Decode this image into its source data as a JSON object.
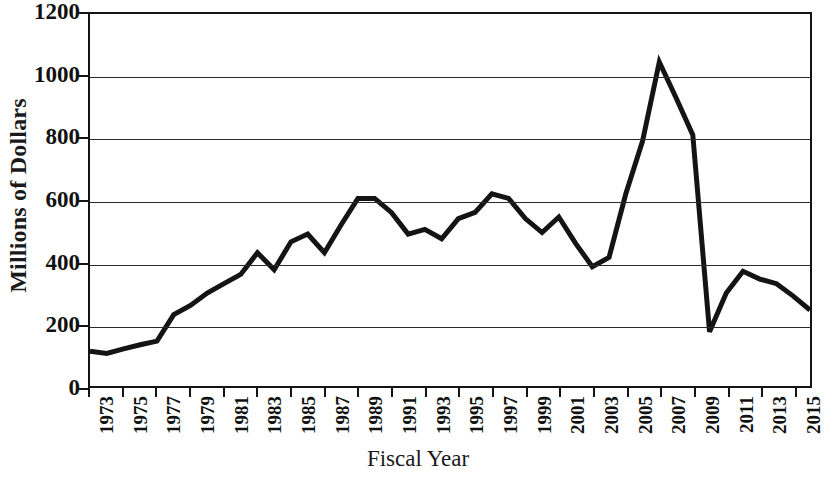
{
  "chart_data": {
    "type": "line",
    "title": "",
    "xlabel": "Fiscal Year",
    "ylabel": "Millions of Dollars",
    "xlim": [
      1973,
      2016
    ],
    "ylim": [
      0,
      1200
    ],
    "grid": true,
    "legend": null,
    "line_color": "#141414",
    "y_ticks": [
      0,
      200,
      400,
      600,
      800,
      1000,
      1200
    ],
    "y_tick_labels": [
      "0",
      "200",
      "400",
      "600",
      "800",
      "1000",
      "1200"
    ],
    "x_ticks": [
      1973,
      1975,
      1977,
      1979,
      1981,
      1983,
      1985,
      1987,
      1989,
      1991,
      1993,
      1995,
      1997,
      1999,
      2001,
      2003,
      2005,
      2007,
      2009,
      2011,
      2013,
      2015
    ],
    "x_tick_labels": [
      "1973",
      "1975",
      "1977",
      "1979",
      "1981",
      "1983",
      "1985",
      "1987",
      "1989",
      "1991",
      "1993",
      "1995",
      "1997",
      "1999",
      "2001",
      "2003",
      "2005",
      "2007",
      "2009",
      "2011",
      "2013",
      "2015"
    ],
    "x": [
      1973,
      1974,
      1975,
      1976,
      1977,
      1978,
      1979,
      1980,
      1981,
      1982,
      1983,
      1984,
      1985,
      1986,
      1987,
      1988,
      1989,
      1990,
      1991,
      1992,
      1993,
      1994,
      1995,
      1996,
      1997,
      1998,
      1999,
      2000,
      2001,
      2002,
      2003,
      2004,
      2005,
      2006,
      2007,
      2008,
      2009,
      2010,
      2011,
      2012,
      2013,
      2014,
      2015,
      2016
    ],
    "values": [
      112,
      105,
      120,
      133,
      145,
      230,
      260,
      300,
      330,
      360,
      430,
      375,
      465,
      490,
      430,
      520,
      605,
      605,
      560,
      490,
      505,
      475,
      540,
      560,
      620,
      605,
      540,
      495,
      545,
      460,
      385,
      415,
      620,
      790,
      1045,
      930,
      810,
      175,
      300,
      370,
      345,
      330,
      290,
      245
    ]
  }
}
